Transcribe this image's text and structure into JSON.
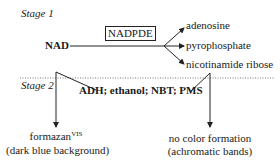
{
  "stages": {
    "stage1": "Stage 1",
    "stage2": "Stage 2"
  },
  "nodes": {
    "substrate": "NAD",
    "enzyme": "NADPDE",
    "products": [
      "adenosine",
      "pyrophosphate",
      "nicotinamide ribose"
    ],
    "reagents": "ADH; ethanol; NBT; PMS",
    "left_outcome": {
      "main": "formazan",
      "superscript": "VIS",
      "note": "(dark blue background)"
    },
    "right_outcome": {
      "main": "no color formation",
      "note": "(achromatic bands)"
    }
  }
}
